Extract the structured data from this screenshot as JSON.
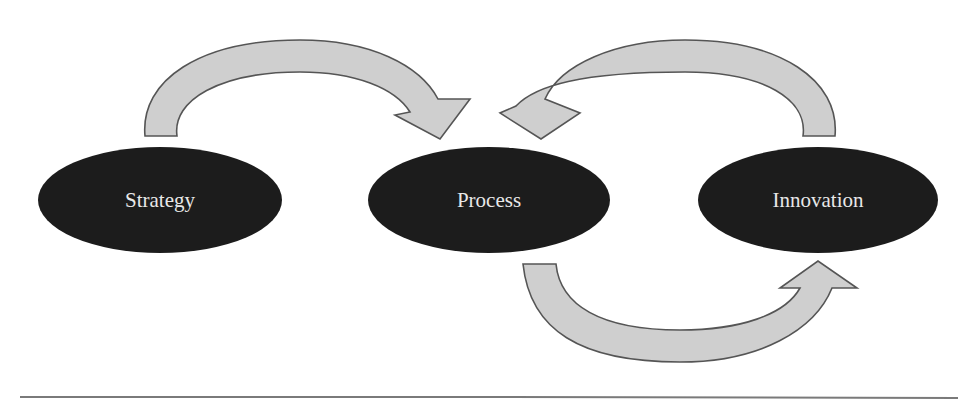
{
  "diagram": {
    "nodes": [
      {
        "id": "strategy",
        "label": "Strategy"
      },
      {
        "id": "process",
        "label": "Process"
      },
      {
        "id": "innovation",
        "label": "Innovation"
      }
    ],
    "edges": [
      {
        "from": "strategy",
        "to": "process",
        "path": "over-top"
      },
      {
        "from": "innovation",
        "to": "process",
        "path": "over-top"
      },
      {
        "from": "process",
        "to": "innovation",
        "path": "under-bottom"
      }
    ],
    "colors": {
      "node_fill": "#1c1c1c",
      "node_text": "#e8e8e8",
      "arrow_fill": "#cfcfcf",
      "arrow_stroke": "#555555",
      "rule": "#7a7a7a"
    }
  }
}
